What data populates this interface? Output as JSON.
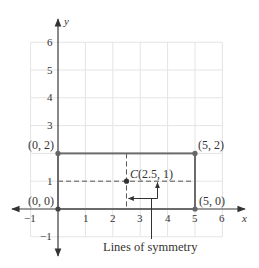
{
  "diagram": {
    "type": "coordinate-plane",
    "title": "",
    "axes": {
      "x_label": "x",
      "y_label": "y",
      "x_range": [
        -1,
        6
      ],
      "y_range": [
        -1,
        6
      ],
      "x_ticks": [
        "−1",
        "1",
        "2",
        "3",
        "4",
        "5",
        "6"
      ],
      "y_ticks": [
        "−1",
        "1",
        "3",
        "4",
        "5",
        "6"
      ]
    },
    "rectangle": {
      "vertices": [
        [
          0,
          0
        ],
        [
          5,
          0
        ],
        [
          5,
          2
        ],
        [
          0,
          2
        ]
      ],
      "edge_color": "#6b6b6b"
    },
    "point_labels": {
      "p00": "(0, 0)",
      "p02": "(0, 2)",
      "p52": "(5, 2)",
      "p50": "(5, 0)"
    },
    "center": {
      "prefix": "C",
      "coords": "(2.5, 1)",
      "x": 2.5,
      "y": 1
    },
    "lines_of_symmetry": {
      "vertical": "x = 2.5",
      "horizontal": "y = 1",
      "caption": "Lines of symmetry"
    },
    "colors": {
      "grid": "#e4e4e4",
      "axis": "#3a3a3a",
      "rectangle": "#6b6b6b",
      "text": "#333333"
    }
  }
}
